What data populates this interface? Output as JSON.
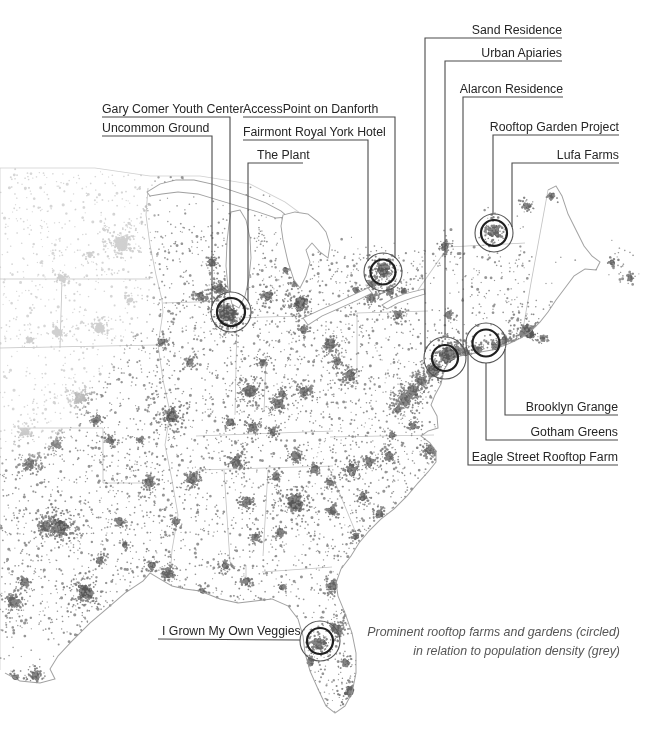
{
  "caption": {
    "line1": "Prominent rooftop farms and gardens (circled)",
    "line2": "in relation to population density (grey)"
  },
  "colors": {
    "background": "#ffffff",
    "label_text": "#262626",
    "caption_text": "#565656",
    "leader_line": "#4a4a4a",
    "circle_outer": "#555555",
    "circle_inner": "#1f1f1f",
    "dot": "#868686",
    "dot_dark": "#646464",
    "dot_core": "#575757",
    "dot_faded": "#d0d0d0",
    "border_line": "#bbbbbb",
    "coast_line": "#9a9a9a"
  },
  "annotations": {
    "circles": [
      {
        "id": "circle-chicago",
        "cx": 231,
        "cy": 312,
        "r_outer": 20,
        "r_inner": 14
      },
      {
        "id": "circle-toronto",
        "cx": 383,
        "cy": 272,
        "r_outer": 19,
        "r_inner": 12.5
      },
      {
        "id": "circle-montreal",
        "cx": 494,
        "cy": 233,
        "r_outer": 19,
        "r_inner": 13
      },
      {
        "id": "circle-northeast-a",
        "cx": 445,
        "cy": 358,
        "r_outer": 21,
        "r_inner": 13
      },
      {
        "id": "circle-northeast-b",
        "cx": 486,
        "cy": 343,
        "r_outer": 20,
        "r_inner": 13.5
      },
      {
        "id": "circle-florida",
        "cx": 320,
        "cy": 641,
        "r_outer": 20,
        "r_inner": 13
      }
    ],
    "labels": [
      {
        "text": "Sand Residence",
        "align": "right",
        "x": 562,
        "y": 23,
        "line": [
          [
            562,
            38
          ],
          [
            425,
            38
          ],
          [
            425,
            352
          ]
        ]
      },
      {
        "text": "Urban Apiaries",
        "align": "right",
        "x": 562,
        "y": 46,
        "line": [
          [
            562,
            61
          ],
          [
            445,
            61
          ],
          [
            445,
            337
          ]
        ]
      },
      {
        "text": "Alarcon Residence",
        "align": "right",
        "x": 563,
        "y": 82,
        "line": [
          [
            563,
            97
          ],
          [
            463,
            97
          ],
          [
            463,
            347
          ]
        ]
      },
      {
        "text": "Gary Comer Youth Center",
        "align": "left",
        "x": 102,
        "y": 102,
        "line": [
          [
            102,
            117
          ],
          [
            230,
            117
          ],
          [
            230,
            292
          ]
        ]
      },
      {
        "text": "AccessPoint on Danforth",
        "align": "left",
        "x": 243,
        "y": 102,
        "line": [
          [
            243,
            117
          ],
          [
            395,
            117
          ],
          [
            395,
            258
          ]
        ]
      },
      {
        "text": "Uncommon Ground",
        "align": "left",
        "x": 102,
        "y": 121,
        "line": [
          [
            102,
            136
          ],
          [
            212,
            136
          ],
          [
            212,
            306
          ]
        ]
      },
      {
        "text": "Fairmont Royal York Hotel",
        "align": "left",
        "x": 243,
        "y": 125,
        "line": [
          [
            243,
            140
          ],
          [
            368,
            140
          ],
          [
            368,
            261
          ]
        ]
      },
      {
        "text": "Rooftop Garden Project",
        "align": "right",
        "x": 619,
        "y": 120,
        "line": [
          [
            619,
            135
          ],
          [
            493,
            135
          ],
          [
            493,
            214
          ]
        ]
      },
      {
        "text": "The Plant",
        "align": "left",
        "x": 257,
        "y": 148,
        "line": [
          [
            303,
            163
          ],
          [
            248,
            163
          ],
          [
            248,
            301
          ]
        ]
      },
      {
        "text": "Lufa Farms",
        "align": "right",
        "x": 619,
        "y": 148,
        "line": [
          [
            619,
            163
          ],
          [
            512,
            163
          ],
          [
            512,
            227
          ]
        ]
      },
      {
        "text": "Brooklyn Grange",
        "align": "right",
        "x": 618,
        "y": 400,
        "line": [
          [
            505,
            349
          ],
          [
            505,
            415
          ],
          [
            618,
            415
          ]
        ]
      },
      {
        "text": "Gotham Greens",
        "align": "right",
        "x": 618,
        "y": 425,
        "line": [
          [
            486,
            363
          ],
          [
            486,
            440
          ],
          [
            618,
            440
          ]
        ]
      },
      {
        "text": "Eagle Street Rooftop Farm",
        "align": "right",
        "x": 618,
        "y": 450,
        "line": [
          [
            468,
            352
          ],
          [
            468,
            465
          ],
          [
            618,
            465
          ]
        ]
      },
      {
        "text": "I Grown My Own Veggies",
        "align": "left",
        "x": 162,
        "y": 624,
        "line": [
          [
            158,
            639
          ],
          [
            300,
            640
          ]
        ]
      }
    ]
  },
  "map": {
    "clusters": [
      [
        122,
        244,
        7
      ],
      [
        100,
        328,
        3
      ],
      [
        58,
        332,
        3
      ],
      [
        80,
        398,
        5
      ],
      [
        62,
        278,
        2
      ],
      [
        25,
        432,
        3
      ],
      [
        110,
        440,
        2
      ],
      [
        90,
        255,
        1
      ],
      [
        130,
        300,
        1
      ],
      [
        30,
        340,
        1
      ],
      [
        228,
        314,
        9
      ],
      [
        220,
        289,
        5
      ],
      [
        201,
        296,
        2
      ],
      [
        212,
        262,
        2
      ],
      [
        268,
        296,
        3
      ],
      [
        300,
        304,
        6
      ],
      [
        296,
        283,
        2
      ],
      [
        286,
        270,
        1
      ],
      [
        330,
        345,
        4
      ],
      [
        303,
        330,
        2
      ],
      [
        350,
        375,
        4
      ],
      [
        337,
        362,
        2
      ],
      [
        372,
        298,
        3
      ],
      [
        390,
        291,
        2
      ],
      [
        404,
        292,
        1
      ],
      [
        448,
        315,
        2
      ],
      [
        398,
        315,
        2
      ],
      [
        383,
        270,
        6
      ],
      [
        372,
        284,
        2
      ],
      [
        356,
        290,
        1
      ],
      [
        445,
        247,
        2
      ],
      [
        494,
        231,
        5
      ],
      [
        527,
        206,
        2
      ],
      [
        552,
        196,
        1
      ],
      [
        528,
        333,
        7
      ],
      [
        518,
        344,
        3
      ],
      [
        494,
        346,
        3
      ],
      [
        505,
        340,
        2
      ],
      [
        478,
        350,
        2
      ],
      [
        465,
        352,
        2
      ],
      [
        458,
        350,
        2
      ],
      [
        449,
        356,
        9
      ],
      [
        433,
        371,
        6
      ],
      [
        421,
        381,
        3
      ],
      [
        412,
        391,
        5
      ],
      [
        405,
        400,
        5
      ],
      [
        398,
        409,
        2
      ],
      [
        413,
        426,
        2
      ],
      [
        430,
        450,
        4
      ],
      [
        392,
        435,
        1
      ],
      [
        543,
        339,
        1
      ],
      [
        250,
        391,
        5
      ],
      [
        278,
        404,
        4
      ],
      [
        304,
        391,
        4
      ],
      [
        282,
        394,
        2
      ],
      [
        262,
        362,
        2
      ],
      [
        253,
        427,
        3
      ],
      [
        273,
        432,
        2
      ],
      [
        236,
        462,
        4
      ],
      [
        296,
        456,
        3
      ],
      [
        315,
        469,
        2
      ],
      [
        192,
        479,
        4
      ],
      [
        150,
        482,
        3
      ],
      [
        172,
        416,
        6
      ],
      [
        190,
        362,
        2
      ],
      [
        162,
        342,
        2
      ],
      [
        230,
        422,
        2
      ],
      [
        295,
        503,
        7
      ],
      [
        276,
        477,
        2
      ],
      [
        246,
        502,
        3
      ],
      [
        352,
        469,
        4
      ],
      [
        370,
        461,
        3
      ],
      [
        389,
        456,
        3
      ],
      [
        363,
        497,
        2
      ],
      [
        330,
        482,
        2
      ],
      [
        332,
        511,
        2
      ],
      [
        356,
        536,
        2
      ],
      [
        380,
        513,
        2
      ],
      [
        256,
        537,
        2
      ],
      [
        280,
        532,
        2
      ],
      [
        226,
        566,
        2
      ],
      [
        246,
        581,
        2
      ],
      [
        282,
        587,
        1
      ],
      [
        202,
        592,
        2
      ],
      [
        168,
        573,
        4
      ],
      [
        152,
        566,
        2
      ],
      [
        176,
        522,
        2
      ],
      [
        120,
        522,
        2
      ],
      [
        60,
        527,
        8
      ],
      [
        46,
        527,
        4
      ],
      [
        25,
        582,
        3
      ],
      [
        85,
        592,
        7
      ],
      [
        14,
        602,
        4
      ],
      [
        30,
        464,
        4
      ],
      [
        56,
        444,
        3
      ],
      [
        96,
        420,
        2
      ],
      [
        140,
        440,
        1
      ],
      [
        35,
        675,
        3
      ],
      [
        15,
        678,
        2
      ],
      [
        100,
        560,
        2
      ],
      [
        125,
        545,
        1
      ],
      [
        332,
        585,
        4
      ],
      [
        337,
        630,
        4
      ],
      [
        319,
        644,
        5
      ],
      [
        352,
        692,
        5
      ],
      [
        346,
        662,
        2
      ],
      [
        310,
        662,
        2
      ],
      [
        348,
        612,
        2
      ],
      [
        612,
        262,
        1
      ],
      [
        630,
        278,
        1
      ]
    ]
  }
}
